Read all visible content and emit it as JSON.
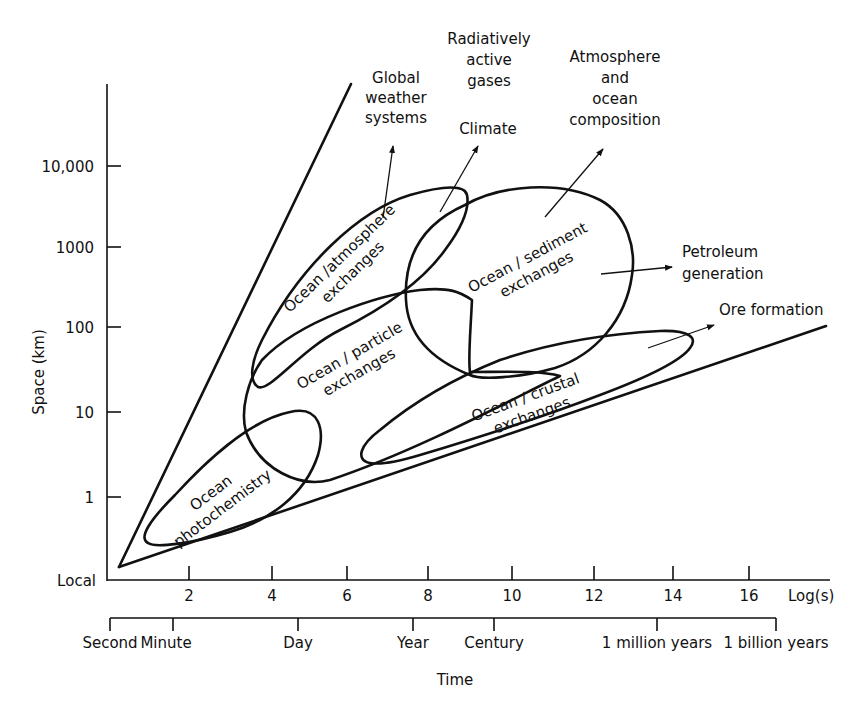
{
  "diagram": {
    "y_axis": {
      "label": "Space (km)",
      "ticks": [
        "10,000",
        "1000",
        "100",
        "10",
        "1",
        "Local"
      ]
    },
    "x_axis": {
      "unit_label": "Log(s)",
      "ticks": [
        "2",
        "4",
        "6",
        "8",
        "10",
        "12",
        "14",
        "16"
      ]
    },
    "time_axis": {
      "label": "Time",
      "ticks": [
        "Second",
        "Minute",
        "Day",
        "Year",
        "Century",
        "1 million years",
        "1 billion years"
      ]
    },
    "regions": {
      "photochemistry": {
        "line1": "Ocean",
        "line2": "photochemistry"
      },
      "atmosphere": {
        "line1": "Ocean /atmosphere",
        "line2": "exchanges"
      },
      "particle": {
        "line1": "Ocean / particle",
        "line2": "exchanges"
      },
      "sediment": {
        "line1": "Ocean / sediment",
        "line2": "exchanges"
      },
      "crustal": {
        "line1": "Ocean / crustal",
        "line2": "exchanges"
      }
    },
    "outcomes": {
      "weather": [
        "Global",
        "weather",
        "systems"
      ],
      "gases": [
        "Radiatively",
        "active",
        "gases"
      ],
      "climate": "Climate",
      "composition": [
        "Atmosphere",
        "and",
        "ocean",
        "composition"
      ],
      "petroleum": [
        "Petroleum",
        "generation"
      ],
      "ore": "Ore formation"
    }
  }
}
